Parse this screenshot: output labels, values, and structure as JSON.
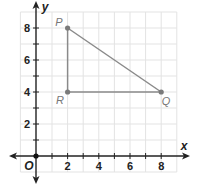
{
  "diagram": {
    "type": "coordinate-plane",
    "axes": {
      "x_label": "x",
      "y_label": "y",
      "origin_label": "O",
      "x_ticks": [
        "2",
        "4",
        "6",
        "8"
      ],
      "y_ticks": [
        "2",
        "4",
        "6",
        "8"
      ]
    },
    "points": [
      {
        "label": "P",
        "x": 2,
        "y": 8
      },
      {
        "label": "R",
        "x": 2,
        "y": 4
      },
      {
        "label": "Q",
        "x": 8,
        "y": 4
      }
    ],
    "segments": [
      [
        "P",
        "R"
      ],
      [
        "R",
        "Q"
      ],
      [
        "Q",
        "P"
      ]
    ],
    "colors": {
      "grid": "#e3e3e3",
      "axis": "#222222",
      "triangle": "#8a8a8a",
      "point": "#7a7a7a",
      "point_label": "#777777"
    }
  }
}
